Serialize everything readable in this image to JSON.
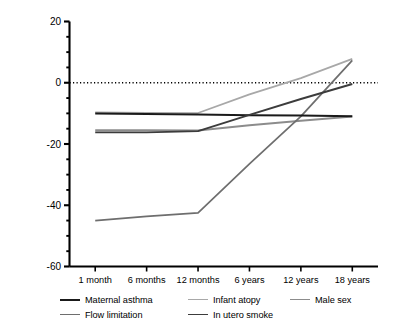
{
  "chart_data": {
    "type": "line",
    "title": "",
    "xlabel": "",
    "ylabel": "Mean difference in % predicted lung function compared with others",
    "categories": [
      "1 month",
      "6 months",
      "12 months",
      "6 years",
      "12 years",
      "18 years"
    ],
    "ylim": [
      -60,
      20
    ],
    "yticks": [
      20,
      0,
      -20,
      -40,
      -60
    ],
    "ytick_labels": [
      "20",
      "0",
      "-20",
      "-40",
      "-60"
    ],
    "minor_tick_step": 5,
    "grid": false,
    "reference_line": {
      "y": 0,
      "style": "dotted"
    },
    "legend_position": "below",
    "series": [
      {
        "name": "Maternal asthma",
        "color": "#1a1a1a",
        "values": [
          -10.0,
          -10.2,
          -10.4,
          -10.6,
          -10.7,
          -10.9
        ]
      },
      {
        "name": "Infant atopy",
        "color": "#a8a8a8",
        "values": [
          -9.7,
          -9.8,
          -9.9,
          -3.8,
          1.5,
          7.8
        ]
      },
      {
        "name": "Male sex",
        "color": "#8c8c8c",
        "values": [
          -15.5,
          -15.5,
          -15.6,
          -13.9,
          -12.4,
          -11.0
        ]
      },
      {
        "name": "Flow limitation",
        "color": "#6e6e6e",
        "values": [
          -45.0,
          -43.6,
          -42.5,
          -26.5,
          -11.0,
          7.3
        ]
      },
      {
        "name": "In utero smoke",
        "color": "#3c3c3c",
        "values": [
          -16.2,
          -16.2,
          -15.8,
          -10.5,
          -5.3,
          -0.4
        ]
      }
    ]
  },
  "axes": {
    "y_axis_title": "Mean difference in % predicted lung function compared with others"
  },
  "legend": {
    "rows": [
      [
        {
          "label": "Maternal asthma",
          "color": "#1a1a1a",
          "width": 2.0
        },
        {
          "label": "Infant atopy",
          "color": "#a8a8a8",
          "width": 1.7
        },
        {
          "label": "Male sex",
          "color": "#8c8c8c",
          "width": 1.9
        }
      ],
      [
        {
          "label": "Flow limitation",
          "color": "#6e6e6e",
          "width": 1.7
        },
        {
          "label": "In utero smoke",
          "color": "#3c3c3c",
          "width": 1.9
        }
      ]
    ]
  }
}
